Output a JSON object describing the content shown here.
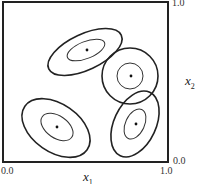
{
  "diagram": {
    "axes": {
      "x_label": "x",
      "x_sub": "1",
      "y_label": "x",
      "y_sub": "2",
      "ticks": {
        "x_min": "0.0",
        "x_max": "1.0",
        "y_min": "0.0",
        "y_max": "1.0"
      }
    },
    "components": [
      {
        "name": "top-center",
        "center": [
          0.5,
          0.7
        ]
      },
      {
        "name": "right-circle",
        "center": [
          0.76,
          0.53
        ]
      },
      {
        "name": "bottom-left",
        "center": [
          0.33,
          0.22
        ]
      },
      {
        "name": "bottom-right",
        "center": [
          0.79,
          0.24
        ]
      }
    ]
  }
}
